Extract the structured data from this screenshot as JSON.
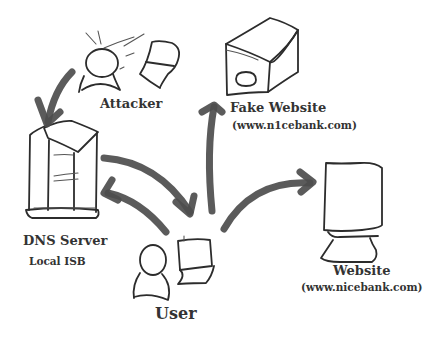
{
  "diagram": {
    "nodes": {
      "attacker": {
        "label": "Attacker"
      },
      "fake_website": {
        "label": "Fake Website",
        "url": "(www.n1cebank.com)"
      },
      "dns_server": {
        "label": "DNS Server",
        "sublabel": "Local ISB"
      },
      "user": {
        "label": "User"
      },
      "website": {
        "label": "Website",
        "url": "(www.nicebank.com)"
      }
    },
    "edges": [
      {
        "from": "attacker",
        "to": "dns_server"
      },
      {
        "from": "dns_server",
        "to": "user"
      },
      {
        "from": "user",
        "to": "dns_server"
      },
      {
        "from": "user",
        "to": "fake_website"
      },
      {
        "from": "user",
        "to": "website"
      }
    ],
    "colors": {
      "stroke": "#2c2c2c",
      "arrow": "#4d4d4d",
      "text": "#333333",
      "background": "#ffffff"
    }
  }
}
